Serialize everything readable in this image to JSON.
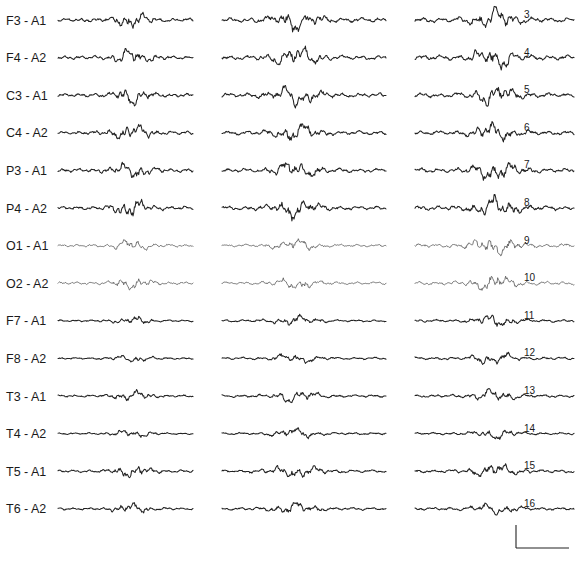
{
  "chart_data": {
    "type": "line",
    "title": "",
    "xlabel": "",
    "ylabel": "",
    "grid": false,
    "legend": "none",
    "columns": 3,
    "channels": [
      {
        "label": "F3 - A1",
        "number": "3",
        "activity": {
          "c1": 0.8,
          "c2": 1.0,
          "c3": 1.1
        }
      },
      {
        "label": "F4 - A2",
        "number": "4",
        "activity": {
          "c1": 0.8,
          "c2": 1.0,
          "c3": 1.1
        }
      },
      {
        "label": "C3 - A1",
        "number": "5",
        "activity": {
          "c1": 0.8,
          "c2": 1.0,
          "c3": 1.0
        }
      },
      {
        "label": "C4 - A2",
        "number": "6",
        "activity": {
          "c1": 0.8,
          "c2": 0.9,
          "c3": 0.9
        }
      },
      {
        "label": "P3 - A1",
        "number": "7",
        "activity": {
          "c1": 0.8,
          "c2": 0.9,
          "c3": 1.0
        }
      },
      {
        "label": "P4 - A2",
        "number": "8",
        "activity": {
          "c1": 0.8,
          "c2": 0.9,
          "c3": 1.0
        }
      },
      {
        "label": "O1 - A1",
        "number": "9",
        "activity": {
          "c1": 0.6,
          "c2": 0.6,
          "c3": 0.9
        }
      },
      {
        "label": "O2 - A2",
        "number": "10",
        "activity": {
          "c1": 0.6,
          "c2": 0.6,
          "c3": 0.8
        }
      },
      {
        "label": "F7 - A1",
        "number": "11",
        "activity": {
          "c1": 0.4,
          "c2": 0.5,
          "c3": 0.6
        }
      },
      {
        "label": "F8 - A2",
        "number": "12",
        "activity": {
          "c1": 0.4,
          "c2": 0.5,
          "c3": 0.6
        }
      },
      {
        "label": "T3 - A1",
        "number": "13",
        "activity": {
          "c1": 0.5,
          "c2": 0.6,
          "c3": 0.6
        }
      },
      {
        "label": "T4 - A2",
        "number": "14",
        "activity": {
          "c1": 0.4,
          "c2": 0.5,
          "c3": 0.5
        }
      },
      {
        "label": "T5 - A1",
        "number": "15",
        "activity": {
          "c1": 0.6,
          "c2": 0.7,
          "c3": 0.7
        }
      },
      {
        "label": "T6 - A2",
        "number": "16",
        "activity": {
          "c1": 0.5,
          "c2": 0.6,
          "c3": 0.6
        }
      }
    ],
    "calibration_bar": {
      "shown": true,
      "units_labeled": false
    }
  }
}
